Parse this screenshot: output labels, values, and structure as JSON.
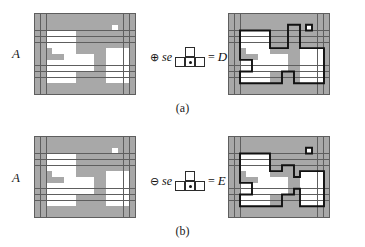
{
  "figure": {
    "type": "morphological-operations-diagram",
    "grid_cols": 17,
    "grid_rows": 14,
    "colors": {
      "background_cell": "#a8a8a8",
      "foreground_cell": "#ffffff",
      "gridline": "#5e5e5e",
      "outline": "#111111",
      "page": "#ffffff"
    },
    "structuring_element": {
      "name": "se",
      "label": "se",
      "shape": "T-shape: one cell above center, plus three cells in a horizontal row",
      "origin_marker": "dot",
      "cells": [
        [
          0,
          1
        ],
        [
          1,
          0
        ],
        [
          1,
          1
        ],
        [
          1,
          2
        ]
      ],
      "origin": [
        1,
        1
      ]
    }
  },
  "panels": [
    {
      "id": "a",
      "caption": "(a)",
      "input_label": "A",
      "operator_symbol": "⊕",
      "operator_name": "dilation",
      "se_label": "se",
      "equals": "=",
      "result_label": "D",
      "left_grid": {
        "name": "A",
        "rows": [
          "00000000000000000",
          "00000000000000000",
          "00000000000001000",
          "00111110000000000",
          "00111110000000000",
          "00111110000000000",
          "00011110000011110",
          "00000111110011110",
          "00111111110011110",
          "00111111110011110",
          "00111110000011110",
          "00111110000011110",
          "00000000000000000",
          "00000000000000000"
        ]
      },
      "right_grid": {
        "name": "D",
        "description": "Same image A with a bold black outline marking the dilated region boundary; the isolated single pixel near the top-right is outlined as a small square.",
        "rows": [
          "00000000000000000",
          "00000000000000000",
          "00000000000001000",
          "00111110000000000",
          "00111110000000000",
          "00111110000000000",
          "00011110000011110",
          "00000111110011110",
          "00111111110011110",
          "00111111110011110",
          "00111110000011110",
          "00111110000011110",
          "00000000000000000",
          "00000000000000000"
        ],
        "outline_paths": [
          [
            [
              2,
              3
            ],
            [
              7,
              3
            ],
            [
              7,
              6
            ],
            [
              10,
              6
            ],
            [
              10,
              2
            ],
            [
              12,
              2
            ],
            [
              12,
              6
            ],
            [
              16,
              6
            ],
            [
              16,
              12
            ],
            [
              11,
              12
            ],
            [
              11,
              10
            ],
            [
              9,
              10
            ],
            [
              9,
              12
            ],
            [
              2,
              12
            ],
            [
              2,
              10
            ],
            [
              4,
              10
            ],
            [
              4,
              8
            ],
            [
              2,
              8
            ]
          ],
          [
            [
              13,
              2
            ],
            [
              14,
              2
            ],
            [
              14,
              3
            ],
            [
              13,
              3
            ]
          ]
        ]
      }
    },
    {
      "id": "b",
      "caption": "(b)",
      "input_label": "A",
      "operator_symbol": "⊖",
      "operator_name": "erosion",
      "se_label": "se",
      "equals": "=",
      "result_label": "E",
      "left_grid": {
        "name": "A",
        "rows": [
          "00000000000000000",
          "00000000000000000",
          "00000000000001000",
          "00111110000000000",
          "00111110000000000",
          "00111110000000000",
          "00011110000011110",
          "00000111110011110",
          "00111111110011110",
          "00111111110011110",
          "00111110000011110",
          "00111110000011110",
          "00000000000000000",
          "00000000000000000"
        ]
      },
      "right_grid": {
        "name": "E",
        "description": "Same image A with a bold black outline marking the eroded region boundary; the isolated single pixel near the top-right is outlined as a small square and lies outside the eroded set.",
        "rows": [
          "00000000000000000",
          "00000000000000000",
          "00000000000001000",
          "00111110000000000",
          "00111110000000000",
          "00111110000000000",
          "00011110000011110",
          "00000111110011110",
          "00111111110011110",
          "00111111110011110",
          "00111110000011110",
          "00111110000011110",
          "00000000000000000",
          "00000000000000000"
        ],
        "outline_paths": [
          [
            [
              2,
              3
            ],
            [
              7,
              3
            ],
            [
              7,
              6
            ],
            [
              9,
              6
            ],
            [
              9,
              5
            ],
            [
              11,
              5
            ],
            [
              11,
              7
            ],
            [
              12,
              7
            ],
            [
              12,
              6
            ],
            [
              16,
              6
            ],
            [
              16,
              12
            ],
            [
              12,
              12
            ],
            [
              12,
              9
            ],
            [
              11,
              9
            ],
            [
              11,
              10
            ],
            [
              9,
              10
            ],
            [
              9,
              12
            ],
            [
              2,
              12
            ],
            [
              2,
              10
            ],
            [
              4,
              10
            ],
            [
              4,
              8
            ],
            [
              2,
              8
            ]
          ],
          [
            [
              13,
              2
            ],
            [
              14,
              2
            ],
            [
              14,
              3
            ],
            [
              13,
              3
            ]
          ]
        ]
      }
    }
  ]
}
